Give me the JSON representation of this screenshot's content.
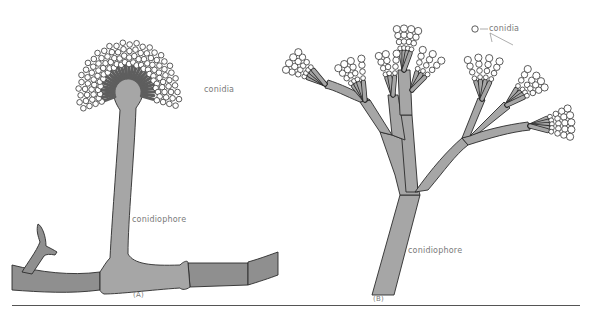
{
  "figure": {
    "panels": [
      {
        "id": "A",
        "caption": "(A)",
        "labels": {
          "spores": "conidia",
          "stalk": "conidiophore"
        },
        "structure": "single conidiophore with swollen vesicle head bearing radiating phialides and chains of conidia, arising from septate hypha"
      },
      {
        "id": "B",
        "caption": "(B)",
        "labels": {
          "spores": "conidia",
          "stalk": "conidiophore"
        },
        "structure": "branched brush-like conidiophore with metulae and phialides bearing chains of conidia"
      }
    ],
    "colors": {
      "hypha_fill": "#8f8f8f",
      "conidiophore_fill": "#a6a6a6",
      "outline": "#2b2b2b",
      "label_text": "#7a7a7a",
      "background": "#ffffff"
    }
  }
}
